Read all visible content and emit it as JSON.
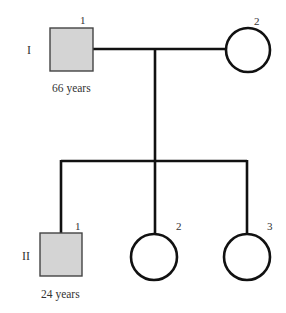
{
  "diagram": {
    "type": "pedigree",
    "colors": {
      "affected_fill": "#d4d4d4",
      "line": "#111111",
      "text": "#333333"
    },
    "generations": [
      {
        "label": "I",
        "members": [
          {
            "number": "1",
            "sex": "male",
            "affected": true,
            "age": "66 years"
          },
          {
            "number": "2",
            "sex": "female",
            "affected": false
          }
        ]
      },
      {
        "label": "II",
        "members": [
          {
            "number": "1",
            "sex": "male",
            "affected": true,
            "age": "24 years"
          },
          {
            "number": "2",
            "sex": "female",
            "affected": false
          },
          {
            "number": "3",
            "sex": "female",
            "affected": false
          }
        ]
      }
    ]
  }
}
